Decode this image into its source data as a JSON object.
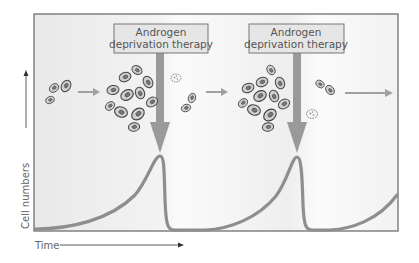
{
  "figure": {
    "type": "diagram",
    "therapy_boxes": [
      {
        "line1": "Androgen",
        "line2": "deprivation therapy"
      },
      {
        "line1": "Androgen",
        "line2": "deprivation therapy"
      }
    ],
    "axes": {
      "y_label": "Cell numbers",
      "x_label": "Time"
    },
    "stages": [
      "small cluster of cells",
      "large proliferating cluster",
      "surviving cells and dying cell after therapy",
      "large proliferating cluster",
      "surviving cells and dying cell after therapy",
      "continued growth"
    ],
    "colors": {
      "panel_background": "#efefef",
      "frame": "#6f6f6f",
      "curve": "#8e8e8e",
      "arrow": "#9a9a9a",
      "box_fill": "#e6e6e6",
      "box_border": "#777777",
      "cell_fill": "#cfcfcf",
      "cell_outline": "#444444",
      "nucleus": "#777777"
    }
  }
}
